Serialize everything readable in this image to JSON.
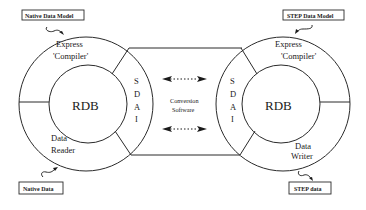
{
  "diagram": {
    "title": "",
    "left_system": {
      "model_label": "Native Data Model",
      "data_label": "Native Data",
      "outer_top": [
        "Express",
        "'Compiler'"
      ],
      "core": "RDB",
      "outer_bottom": [
        "Data",
        "Reader"
      ],
      "interface": [
        "S",
        "D",
        "A",
        "I"
      ]
    },
    "right_system": {
      "model_label": "STEP Data Model",
      "data_label": "STEP data",
      "outer_top": [
        "Express",
        "'Compiler'"
      ],
      "core": "RDB",
      "outer_bottom": [
        "Data",
        "Writer"
      ],
      "interface": [
        "S",
        "D",
        "A",
        "I"
      ]
    },
    "bridge": {
      "label": [
        "Conversion",
        "Software"
      ],
      "arrows": [
        "bidirectional-arrow-top",
        "bidirectional-arrow-bottom"
      ]
    },
    "colors": {
      "line": "#2a2a2a",
      "background": "#ffffff",
      "text": "#1a1a1a"
    }
  }
}
